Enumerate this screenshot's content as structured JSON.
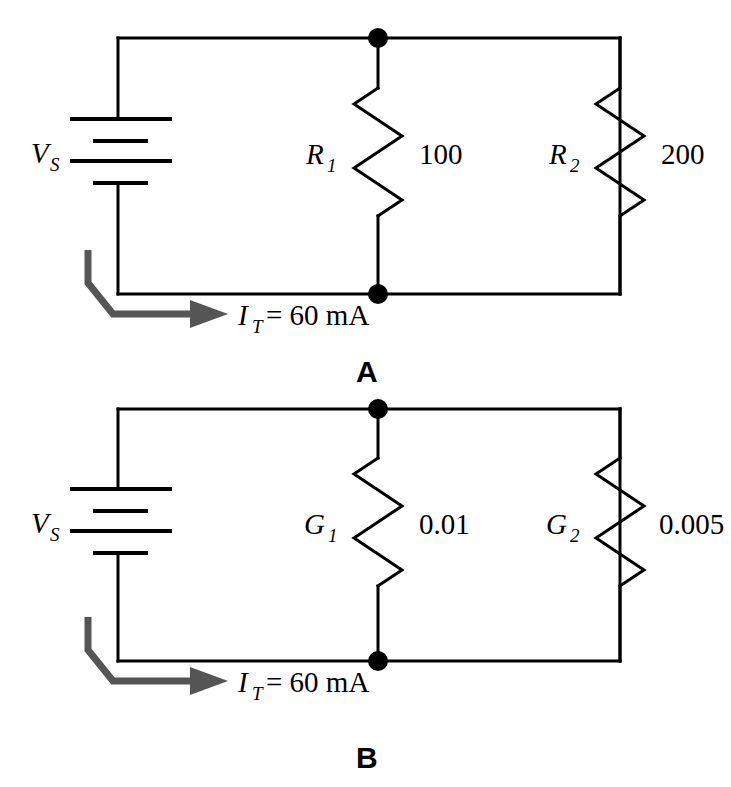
{
  "figure": {
    "background_color": "#ffffff",
    "wire_color": "#000000",
    "arrow_color": "#555555"
  },
  "panels": [
    {
      "letter": "A",
      "source": {
        "label_symbol": "V",
        "label_subscript": "S",
        "component": "battery"
      },
      "branches": [
        {
          "symbol": "R",
          "subscript": "1",
          "value": "100",
          "component": "resistor"
        },
        {
          "symbol": "R",
          "subscript": "2",
          "value": "200",
          "component": "resistor"
        }
      ],
      "current": {
        "symbol": "I",
        "subscript": "T",
        "equals": "=",
        "value": "60",
        "unit": "mA",
        "full_text": "= 60 mA"
      },
      "nodes": [
        {
          "name": "top-node",
          "x": 378,
          "y": 38
        },
        {
          "name": "bottom-node",
          "x": 378,
          "y": 294
        }
      ]
    },
    {
      "letter": "B",
      "source": {
        "label_symbol": "V",
        "label_subscript": "S",
        "component": "battery"
      },
      "branches": [
        {
          "symbol": "G",
          "subscript": "1",
          "value": "0.01",
          "component": "resistor"
        },
        {
          "symbol": "G",
          "subscript": "2",
          "value": "0.005",
          "component": "resistor"
        }
      ],
      "current": {
        "symbol": "I",
        "subscript": "T",
        "equals": "=",
        "value": "60",
        "unit": "mA",
        "full_text": "= 60 mA"
      },
      "nodes": [
        {
          "name": "top-node",
          "x": 378,
          "y": 409
        },
        {
          "name": "bottom-node",
          "x": 378,
          "y": 661
        }
      ]
    }
  ]
}
